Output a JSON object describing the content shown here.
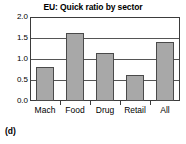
{
  "chart_data": {
    "type": "bar",
    "title": "EU: Quick ratio by sector",
    "xlabel": "",
    "ylabel": "",
    "categories": [
      "Mach",
      "Food",
      "Drug",
      "Retail",
      "All"
    ],
    "values": [
      0.82,
      1.61,
      1.15,
      0.62,
      1.41
    ],
    "ylim": [
      0.0,
      2.0
    ],
    "yticks": [
      "0.0",
      "0.5",
      "1.0",
      "1.5",
      "2.0"
    ],
    "ytick_values": [
      0.0,
      0.5,
      1.0,
      1.5,
      2.0
    ],
    "grid": true,
    "gridlines_at": [
      0.5,
      1.0,
      1.5
    ],
    "legend": "none",
    "bar_color": "#a8a8a8",
    "bar_edge_color": "#4a4a4a",
    "frame_color": "#3b3b3b",
    "background": "#ffffff"
  },
  "caption": {
    "panel_label": "(d)"
  }
}
